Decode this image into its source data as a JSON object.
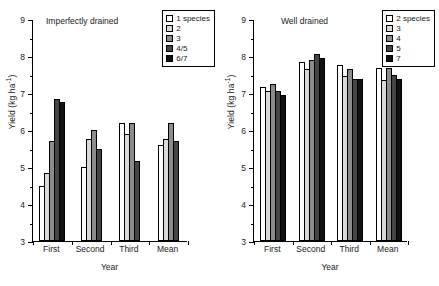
{
  "figure": {
    "panels": [
      "left",
      "right"
    ]
  },
  "axis": {
    "ylabel_text": "Yield (kg ha",
    "ylabel_sup": "-1",
    "ylabel_close": ")",
    "xlabel": "Year",
    "yticks": [
      "9",
      "8",
      "7",
      "6",
      "5",
      "4",
      "3"
    ],
    "ymin": 3,
    "ymax": 9
  },
  "left_panel": {
    "title": "Imperfectly drained",
    "legend": [
      {
        "label": "1 species",
        "color": "#ffffff"
      },
      {
        "label": "2",
        "color": "#d9d9d9"
      },
      {
        "label": "3",
        "color": "#8c8c8c"
      },
      {
        "label": "4/5",
        "color": "#454545"
      },
      {
        "label": "6/7",
        "color": "#111111"
      }
    ]
  },
  "right_panel": {
    "title": "Well drained",
    "legend": [
      {
        "label": "2 species",
        "color": "#ffffff"
      },
      {
        "label": "3",
        "color": "#d9d9d9"
      },
      {
        "label": "4",
        "color": "#8c8c8c"
      },
      {
        "label": "5",
        "color": "#454545"
      },
      {
        "label": "7",
        "color": "#111111"
      }
    ]
  },
  "chart_data": [
    {
      "type": "bar",
      "title": "Imperfectly drained",
      "xlabel": "Year",
      "ylabel": "Yield (kg ha-1)",
      "ylim": [
        3,
        9
      ],
      "yticks": [
        3,
        4,
        5,
        6,
        7,
        8,
        9
      ],
      "grid": false,
      "legend_position": "top-right",
      "categories": [
        "First",
        "Second",
        "Third",
        "Mean"
      ],
      "series": [
        {
          "name": "1 species",
          "color": "#ffffff",
          "values": [
            4.5,
            5.0,
            6.2,
            5.6
          ]
        },
        {
          "name": "2",
          "color": "#d9d9d9",
          "values": [
            4.85,
            5.75,
            5.9,
            5.75
          ]
        },
        {
          "name": "3",
          "color": "#8c8c8c",
          "values": [
            5.7,
            6.0,
            6.2,
            6.2
          ]
        },
        {
          "name": "4/5",
          "color": "#454545",
          "values": [
            6.85,
            5.5,
            5.15,
            5.7
          ]
        },
        {
          "name": "6/7",
          "color": "#111111",
          "values": [
            6.75,
            null,
            null,
            null
          ]
        }
      ]
    },
    {
      "type": "bar",
      "title": "Well drained",
      "xlabel": "Year",
      "ylabel": "Yield (kg ha-1)",
      "ylim": [
        3,
        9
      ],
      "yticks": [
        3,
        4,
        5,
        6,
        7,
        8,
        9
      ],
      "grid": false,
      "legend_position": "top-right",
      "categories": [
        "First",
        "Second",
        "Third",
        "Mean"
      ],
      "series": [
        {
          "name": "2 species",
          "color": "#ffffff",
          "values": [
            7.15,
            7.85,
            7.75,
            7.68
          ]
        },
        {
          "name": "3",
          "color": "#d9d9d9",
          "values": [
            7.05,
            7.65,
            7.45,
            7.35
          ]
        },
        {
          "name": "4",
          "color": "#8c8c8c",
          "values": [
            7.25,
            7.9,
            7.65,
            7.68
          ]
        },
        {
          "name": "5",
          "color": "#454545",
          "values": [
            7.05,
            8.05,
            7.38,
            7.48
          ]
        },
        {
          "name": "7",
          "color": "#111111",
          "values": [
            6.95,
            7.95,
            7.37,
            7.38
          ]
        }
      ]
    }
  ]
}
